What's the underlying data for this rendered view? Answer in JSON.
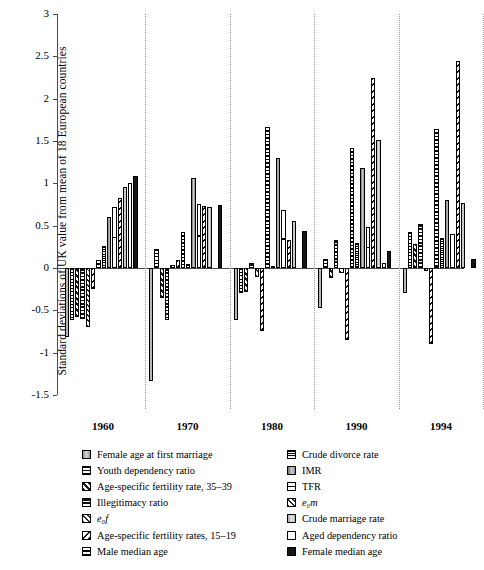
{
  "chart_data": {
    "type": "bar",
    "title": "",
    "xlabel": "",
    "ylabel": "Standard deviations of UK value from mean of 18 European countries",
    "ylim": [
      -1.5,
      3
    ],
    "yticks": [
      "3",
      "2.5",
      "2",
      "1.5",
      "1",
      "0.5",
      "0",
      "-0.5",
      "-1",
      "-1.5"
    ],
    "grid": false,
    "legend_position": "bottom",
    "categories": [
      "1960",
      "1970",
      "1980",
      "1990",
      "1994"
    ],
    "series": [
      {
        "name": "Female age at first marriage",
        "pattern": "p-grad",
        "values": [
          -0.82,
          -1.33,
          -0.62,
          -0.47,
          -0.3
        ]
      },
      {
        "name": "Youth dependency ratio",
        "pattern": "p-hline",
        "values": [
          -0.62,
          0.22,
          -0.3,
          0.11,
          0.42
        ]
      },
      {
        "name": "Age-specific fertility rate, 35-39",
        "pattern": "p-check",
        "values": [
          -0.58,
          -0.36,
          -0.28,
          -0.12,
          0.28
        ]
      },
      {
        "name": "Illegitimacy ratio",
        "pattern": "p-dots",
        "values": [
          -0.6,
          -0.62,
          0.06,
          0.33,
          0.52
        ]
      },
      {
        "name": "e₀f",
        "pattern": "p-xcross",
        "values": [
          -0.7,
          0.04,
          -0.11,
          -0.06,
          -0.04
        ]
      },
      {
        "name": "Age-specific fertility rates, 15-19",
        "pattern": "p-diag",
        "values": [
          -0.25,
          0.09,
          -0.74,
          -0.85,
          -0.9
        ]
      },
      {
        "name": "Male median age",
        "pattern": "p-sqdot",
        "values": [
          0.09,
          0.43,
          1.66,
          1.42,
          1.64
        ]
      },
      {
        "name": "Crude divorce rate",
        "pattern": "p-speck",
        "values": [
          0.26,
          0.05,
          0.02,
          0.3,
          0.36
        ]
      },
      {
        "name": "IMR",
        "pattern": "p-vgrad",
        "values": [
          0.6,
          1.06,
          1.3,
          1.18,
          0.8
        ]
      },
      {
        "name": "TFR",
        "pattern": "p-tfr",
        "values": [
          0.72,
          0.76,
          0.68,
          0.48,
          0.4
        ]
      },
      {
        "name": "e₀m",
        "pattern": "p-diag",
        "values": [
          0.83,
          0.73,
          0.33,
          2.24,
          2.45
        ]
      },
      {
        "name": "Crude marriage rate",
        "pattern": "p-lgrey",
        "values": [
          0.96,
          0.72,
          0.56,
          1.51,
          0.77
        ]
      },
      {
        "name": "Aged dependency ratio",
        "pattern": "p-white",
        "values": [
          1.0,
          0.0,
          0.0,
          0.06,
          0.0
        ]
      },
      {
        "name": "Female median age",
        "pattern": "p-black",
        "values": [
          1.09,
          0.75,
          0.44,
          0.2,
          0.11
        ]
      }
    ]
  },
  "axis": {
    "yticks": [
      {
        "label": "3",
        "value": 3
      },
      {
        "label": "2.5",
        "value": 2.5
      },
      {
        "label": "2",
        "value": 2
      },
      {
        "label": "1.5",
        "value": 1.5
      },
      {
        "label": "1",
        "value": 1
      },
      {
        "label": "0.5",
        "value": 0.5
      },
      {
        "label": "0",
        "value": 0
      },
      {
        "label": "-0.5",
        "value": -0.5
      },
      {
        "label": "-1",
        "value": -1
      },
      {
        "label": "-1.5",
        "value": -1.5
      }
    ],
    "title": "Standard deviations of UK value from mean of 18 European countries",
    "xlabels": [
      "1960",
      "1970",
      "1980",
      "1990",
      "1994"
    ]
  },
  "legend": {
    "left_column": [
      {
        "label": "Female age at first marriage",
        "pattern": "p-grad",
        "italic": false
      },
      {
        "label": "Youth dependency ratio",
        "pattern": "p-hline",
        "italic": false
      },
      {
        "label": "Age-specific fertility rate, 35–39",
        "pattern": "p-check",
        "italic": false
      },
      {
        "label": "Illegitimacy ratio",
        "pattern": "p-dots",
        "italic": false
      },
      {
        "label": "e₀f",
        "pattern": "p-xcross",
        "italic": true
      },
      {
        "label": "Age-specific fertility rates, 15–19",
        "pattern": "p-diag",
        "italic": false
      },
      {
        "label": "Male median age",
        "pattern": "p-sqdot",
        "italic": false
      }
    ],
    "right_column": [
      {
        "label": "Crude divorce rate",
        "pattern": "p-speck",
        "italic": false
      },
      {
        "label": "IMR",
        "pattern": "p-vgrad",
        "italic": false
      },
      {
        "label": "TFR",
        "pattern": "p-tfr",
        "italic": false
      },
      {
        "label": "e₀m",
        "pattern": "p-xcross",
        "italic": true
      },
      {
        "label": "Crude marriage rate",
        "pattern": "p-lgrey",
        "italic": false
      },
      {
        "label": "Aged dependency ratio",
        "pattern": "p-white",
        "italic": false
      },
      {
        "label": "Female median age",
        "pattern": "p-black",
        "italic": false
      }
    ]
  },
  "colors": {
    "axis": "#4a4a4a",
    "separator": "#9a9a9a",
    "bar_outline": "#000000",
    "background": "#ffffff"
  }
}
